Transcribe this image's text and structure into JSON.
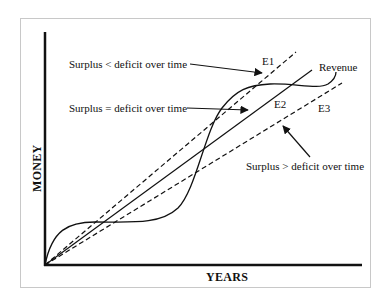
{
  "diagram": {
    "x_axis_label": "YEARS",
    "y_axis_label": "MONEY",
    "curves": [
      {
        "name": "E1",
        "style": "dashed",
        "label": "E1"
      },
      {
        "name": "E2",
        "style": "solid",
        "label": "E2"
      },
      {
        "name": "E3",
        "style": "dashed",
        "label": "E3"
      },
      {
        "name": "Revenue",
        "style": "solid-curve",
        "label": "Revenue"
      }
    ],
    "annotations": [
      {
        "text": "Surplus < deficit over time",
        "points_to": "E1"
      },
      {
        "text": "Surplus = deficit over time",
        "points_to": "E2"
      },
      {
        "text": "Surplus > deficit over time",
        "points_to": "E3"
      }
    ],
    "colors": {
      "line": "#111111",
      "frame": "#c8c8c8",
      "background": "#ffffff"
    }
  }
}
